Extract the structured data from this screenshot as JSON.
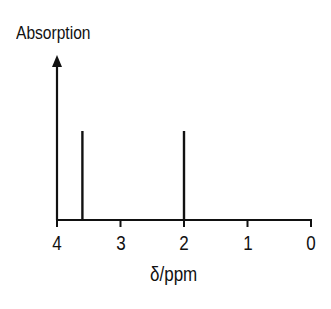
{
  "chart_data": {
    "type": "bar",
    "subtype": "nmr-stick-spectrum",
    "title": "",
    "xlabel": "δ/ppm",
    "ylabel": "Absorption",
    "x_ticks": [
      4,
      3,
      2,
      1,
      0
    ],
    "x_tick_labels": [
      "4",
      "3",
      "2",
      "1",
      "0"
    ],
    "xlim": [
      4,
      0
    ],
    "x_reversed": true,
    "grid": false,
    "legend": null,
    "peaks": [
      {
        "x": 3.6,
        "relative_height": 1.0
      },
      {
        "x": 2.0,
        "relative_height": 1.0
      }
    ],
    "categories": [
      "3.6",
      "2.0"
    ],
    "values": [
      1.0,
      1.0
    ],
    "line_color": "#111111"
  },
  "labels": {
    "ylabel": "Absorption",
    "xlabel": "δ/ppm",
    "ticks": [
      "4",
      "3",
      "2",
      "1",
      "0"
    ]
  }
}
